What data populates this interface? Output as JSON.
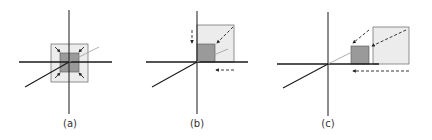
{
  "figure": {
    "panels": [
      {
        "id": "a",
        "label": "(a)",
        "description": "scaling toward origin (centered)"
      },
      {
        "id": "b",
        "label": "(b)",
        "description": "scaling toward origin (quadrant)"
      },
      {
        "id": "c",
        "label": "(c)",
        "description": "scaling with translation"
      }
    ],
    "colors": {
      "axis": "#1a1a1a",
      "diagonal_axis": "#888888",
      "outer_square_fill": "#ececec",
      "outer_square_stroke": "#777777",
      "inner_square_fill": "#9a9a9a",
      "inner_square_stroke": "#555555",
      "arrow": "#222222"
    }
  }
}
